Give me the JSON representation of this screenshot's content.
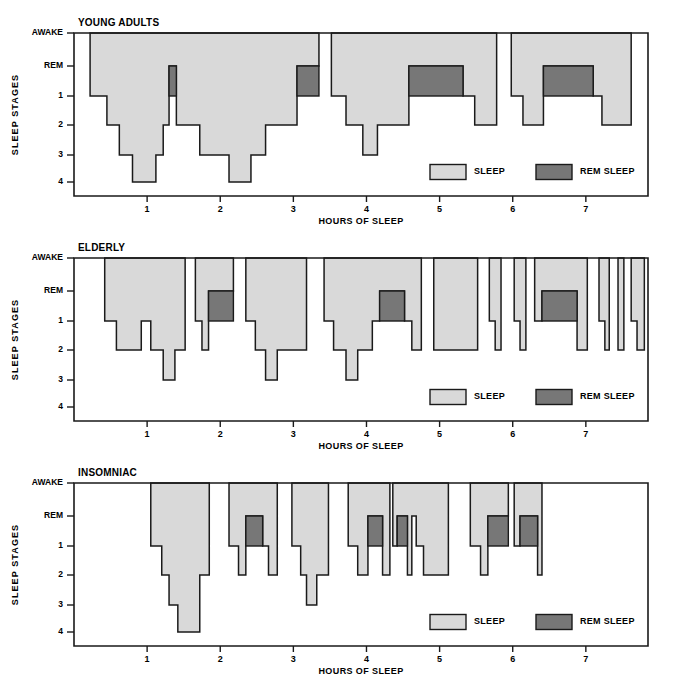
{
  "figure": {
    "colors": {
      "sleep_fill": "#d9d9d9",
      "rem_fill": "#777777",
      "outline": "#1a1a1a",
      "background": "#ffffff"
    },
    "axis_title_y": "SLEEP STAGES",
    "axis_title_x": "HOURS OF SLEEP",
    "y_categories": [
      "AWAKE",
      "REM",
      "1",
      "2",
      "3",
      "4"
    ],
    "x_ticks": [
      1,
      2,
      3,
      4,
      5,
      6,
      7
    ],
    "legend": {
      "sleep_label": "SLEEP",
      "rem_label": "REM SLEEP"
    }
  },
  "chart_data": [
    {
      "type": "area",
      "title": "YOUNG ADULTS",
      "xlabel": "HOURS OF SLEEP",
      "ylabel": "SLEEP STAGES",
      "xlim": [
        0,
        7.85
      ],
      "ylevels": [
        "AWAKE",
        "REM",
        "1",
        "2",
        "3",
        "4"
      ],
      "grid": false,
      "legend_position": "inside-bottom-right",
      "sleep_segments": [
        [
          [
            0.22,
            "AWAKE"
          ],
          [
            0.22,
            "1"
          ],
          [
            0.45,
            "1"
          ],
          [
            0.45,
            "2"
          ],
          [
            0.62,
            "2"
          ],
          [
            0.62,
            "3"
          ],
          [
            0.8,
            "3"
          ],
          [
            0.8,
            "4"
          ],
          [
            1.12,
            "4"
          ],
          [
            1.12,
            "3"
          ],
          [
            1.22,
            "3"
          ],
          [
            1.22,
            "2"
          ],
          [
            1.3,
            "2"
          ],
          [
            1.3,
            "REM"
          ],
          [
            1.4,
            "REM"
          ],
          [
            1.4,
            "2"
          ],
          [
            1.72,
            "2"
          ],
          [
            1.72,
            "3"
          ],
          [
            2.12,
            "3"
          ],
          [
            2.12,
            "4"
          ],
          [
            2.42,
            "4"
          ],
          [
            2.42,
            "3"
          ],
          [
            2.62,
            "3"
          ],
          [
            2.62,
            "2"
          ],
          [
            3.05,
            "2"
          ],
          [
            3.05,
            "REM"
          ],
          [
            3.35,
            "REM"
          ],
          [
            3.35,
            "AWAKE"
          ]
        ],
        [
          [
            3.52,
            "AWAKE"
          ],
          [
            3.52,
            "1"
          ],
          [
            3.72,
            "1"
          ],
          [
            3.72,
            "2"
          ],
          [
            3.95,
            "2"
          ],
          [
            3.95,
            "3"
          ],
          [
            4.15,
            "3"
          ],
          [
            4.15,
            "2"
          ],
          [
            4.58,
            "2"
          ],
          [
            4.58,
            "REM"
          ],
          [
            5.32,
            "REM"
          ],
          [
            5.32,
            "1"
          ],
          [
            5.48,
            "1"
          ],
          [
            5.48,
            "2"
          ],
          [
            5.78,
            "2"
          ],
          [
            5.78,
            "AWAKE"
          ]
        ],
        [
          [
            5.98,
            "AWAKE"
          ],
          [
            5.98,
            "1"
          ],
          [
            6.14,
            "1"
          ],
          [
            6.14,
            "2"
          ],
          [
            6.42,
            "2"
          ],
          [
            6.42,
            "REM"
          ],
          [
            7.1,
            "REM"
          ],
          [
            7.1,
            "1"
          ],
          [
            7.22,
            "1"
          ],
          [
            7.22,
            "2"
          ],
          [
            7.62,
            "2"
          ],
          [
            7.62,
            "AWAKE"
          ]
        ]
      ],
      "rem_blocks": [
        {
          "x0": 1.3,
          "x1": 1.4,
          "top": "REM",
          "bottom": "1"
        },
        {
          "x0": 3.05,
          "x1": 3.35,
          "top": "REM",
          "bottom": "1"
        },
        {
          "x0": 4.58,
          "x1": 5.32,
          "top": "REM",
          "bottom": "1"
        },
        {
          "x0": 6.42,
          "x1": 7.1,
          "top": "REM",
          "bottom": "1"
        }
      ]
    },
    {
      "type": "area",
      "title": "ELDERLY",
      "xlabel": "HOURS OF SLEEP",
      "ylabel": "SLEEP STAGES",
      "xlim": [
        0,
        7.85
      ],
      "ylevels": [
        "AWAKE",
        "REM",
        "1",
        "2",
        "3",
        "4"
      ],
      "grid": false,
      "legend_position": "inside-bottom-right",
      "sleep_segments": [
        [
          [
            0.42,
            "AWAKE"
          ],
          [
            0.42,
            "1"
          ],
          [
            0.58,
            "1"
          ],
          [
            0.58,
            "2"
          ],
          [
            0.92,
            "2"
          ],
          [
            0.92,
            "1"
          ],
          [
            1.05,
            "1"
          ],
          [
            1.05,
            "2"
          ],
          [
            1.22,
            "2"
          ],
          [
            1.22,
            "3"
          ],
          [
            1.38,
            "3"
          ],
          [
            1.38,
            "2"
          ],
          [
            1.52,
            "2"
          ],
          [
            1.52,
            "AWAKE"
          ]
        ],
        [
          [
            1.66,
            "AWAKE"
          ],
          [
            1.66,
            "1"
          ],
          [
            1.75,
            "1"
          ],
          [
            1.75,
            "2"
          ],
          [
            1.84,
            "2"
          ],
          [
            1.84,
            "REM"
          ],
          [
            2.18,
            "REM"
          ],
          [
            2.18,
            "AWAKE"
          ]
        ],
        [
          [
            2.35,
            "AWAKE"
          ],
          [
            2.35,
            "1"
          ],
          [
            2.48,
            "1"
          ],
          [
            2.48,
            "2"
          ],
          [
            2.62,
            "2"
          ],
          [
            2.62,
            "3"
          ],
          [
            2.78,
            "3"
          ],
          [
            2.78,
            "2"
          ],
          [
            3.18,
            "2"
          ],
          [
            3.18,
            "AWAKE"
          ]
        ],
        [
          [
            3.42,
            "AWAKE"
          ],
          [
            3.42,
            "1"
          ],
          [
            3.55,
            "1"
          ],
          [
            3.55,
            "2"
          ],
          [
            3.72,
            "2"
          ],
          [
            3.72,
            "3"
          ],
          [
            3.88,
            "3"
          ],
          [
            3.88,
            "2"
          ],
          [
            4.08,
            "2"
          ],
          [
            4.08,
            "1"
          ],
          [
            4.18,
            "1"
          ],
          [
            4.18,
            "REM"
          ],
          [
            4.52,
            "REM"
          ],
          [
            4.52,
            "1"
          ],
          [
            4.62,
            "1"
          ],
          [
            4.62,
            "2"
          ],
          [
            4.75,
            "2"
          ],
          [
            4.75,
            "AWAKE"
          ]
        ],
        [
          [
            4.92,
            "AWAKE"
          ],
          [
            4.92,
            "2"
          ],
          [
            5.52,
            "2"
          ],
          [
            5.52,
            "AWAKE"
          ]
        ],
        [
          [
            5.68,
            "AWAKE"
          ],
          [
            5.68,
            "1"
          ],
          [
            5.76,
            "1"
          ],
          [
            5.76,
            "2"
          ],
          [
            5.84,
            "2"
          ],
          [
            5.84,
            "AWAKE"
          ]
        ],
        [
          [
            6.02,
            "AWAKE"
          ],
          [
            6.02,
            "1"
          ],
          [
            6.1,
            "1"
          ],
          [
            6.1,
            "2"
          ],
          [
            6.18,
            "2"
          ],
          [
            6.18,
            "AWAKE"
          ]
        ],
        [
          [
            6.3,
            "AWAKE"
          ],
          [
            6.3,
            "1"
          ],
          [
            6.4,
            "1"
          ],
          [
            6.4,
            "REM"
          ],
          [
            6.88,
            "REM"
          ],
          [
            6.88,
            "2"
          ],
          [
            7.02,
            "2"
          ],
          [
            7.02,
            "AWAKE"
          ]
        ],
        [
          [
            7.18,
            "AWAKE"
          ],
          [
            7.18,
            "1"
          ],
          [
            7.26,
            "1"
          ],
          [
            7.26,
            "2"
          ],
          [
            7.32,
            "2"
          ],
          [
            7.32,
            "AWAKE"
          ]
        ],
        [
          [
            7.44,
            "AWAKE"
          ],
          [
            7.44,
            "2"
          ],
          [
            7.52,
            "2"
          ],
          [
            7.52,
            "AWAKE"
          ]
        ],
        [
          [
            7.62,
            "AWAKE"
          ],
          [
            7.62,
            "1"
          ],
          [
            7.7,
            "1"
          ],
          [
            7.7,
            "2"
          ],
          [
            7.8,
            "2"
          ],
          [
            7.8,
            "AWAKE"
          ]
        ]
      ],
      "rem_blocks": [
        {
          "x0": 1.84,
          "x1": 2.18,
          "top": "REM",
          "bottom": "1"
        },
        {
          "x0": 4.18,
          "x1": 4.52,
          "top": "REM",
          "bottom": "1"
        },
        {
          "x0": 6.4,
          "x1": 6.88,
          "top": "REM",
          "bottom": "1"
        }
      ]
    },
    {
      "type": "area",
      "title": "INSOMNIAC",
      "xlabel": "HOURS OF SLEEP",
      "ylabel": "SLEEP STAGES",
      "xlim": [
        0,
        7.85
      ],
      "ylevels": [
        "AWAKE",
        "REM",
        "1",
        "2",
        "3",
        "4"
      ],
      "grid": false,
      "legend_position": "inside-bottom-right",
      "sleep_segments": [
        [
          [
            1.05,
            "AWAKE"
          ],
          [
            1.05,
            "1"
          ],
          [
            1.2,
            "1"
          ],
          [
            1.2,
            "2"
          ],
          [
            1.3,
            "2"
          ],
          [
            1.3,
            "3"
          ],
          [
            1.42,
            "3"
          ],
          [
            1.42,
            "4"
          ],
          [
            1.72,
            "4"
          ],
          [
            1.72,
            "2"
          ],
          [
            1.85,
            "2"
          ],
          [
            1.85,
            "AWAKE"
          ]
        ],
        [
          [
            2.12,
            "AWAKE"
          ],
          [
            2.12,
            "1"
          ],
          [
            2.25,
            "1"
          ],
          [
            2.25,
            "2"
          ],
          [
            2.35,
            "2"
          ],
          [
            2.35,
            "REM"
          ],
          [
            2.58,
            "REM"
          ],
          [
            2.58,
            "1"
          ],
          [
            2.66,
            "1"
          ],
          [
            2.66,
            "2"
          ],
          [
            2.78,
            "2"
          ],
          [
            2.78,
            "AWAKE"
          ]
        ],
        [
          [
            2.98,
            "AWAKE"
          ],
          [
            2.98,
            "1"
          ],
          [
            3.1,
            "1"
          ],
          [
            3.1,
            "2"
          ],
          [
            3.18,
            "2"
          ],
          [
            3.18,
            "3"
          ],
          [
            3.32,
            "3"
          ],
          [
            3.32,
            "2"
          ],
          [
            3.48,
            "2"
          ],
          [
            3.48,
            "AWAKE"
          ]
        ],
        [
          [
            3.75,
            "AWAKE"
          ],
          [
            3.75,
            "1"
          ],
          [
            3.88,
            "1"
          ],
          [
            3.88,
            "2"
          ],
          [
            4.02,
            "2"
          ],
          [
            4.02,
            "REM"
          ],
          [
            4.22,
            "REM"
          ],
          [
            4.22,
            "2"
          ],
          [
            4.32,
            "2"
          ],
          [
            4.32,
            "AWAKE"
          ]
        ],
        [
          [
            4.36,
            "AWAKE"
          ],
          [
            4.36,
            "1"
          ],
          [
            4.42,
            "1"
          ],
          [
            4.42,
            "REM"
          ],
          [
            4.56,
            "REM"
          ],
          [
            4.56,
            "2"
          ],
          [
            4.62,
            "2"
          ],
          [
            4.62,
            "REM"
          ],
          [
            4.68,
            "REM"
          ],
          [
            4.68,
            "1"
          ],
          [
            4.78,
            "1"
          ],
          [
            4.78,
            "2"
          ],
          [
            5.12,
            "2"
          ],
          [
            5.12,
            "AWAKE"
          ]
        ],
        [
          [
            5.42,
            "AWAKE"
          ],
          [
            5.42,
            "1"
          ],
          [
            5.56,
            "1"
          ],
          [
            5.56,
            "2"
          ],
          [
            5.66,
            "2"
          ],
          [
            5.66,
            "REM"
          ],
          [
            5.94,
            "REM"
          ],
          [
            5.94,
            "AWAKE"
          ]
        ],
        [
          [
            6.02,
            "AWAKE"
          ],
          [
            6.02,
            "1"
          ],
          [
            6.1,
            "1"
          ],
          [
            6.1,
            "REM"
          ],
          [
            6.34,
            "REM"
          ],
          [
            6.34,
            "2"
          ],
          [
            6.4,
            "2"
          ],
          [
            6.4,
            "AWAKE"
          ]
        ]
      ],
      "rem_blocks": [
        {
          "x0": 2.35,
          "x1": 2.58,
          "top": "REM",
          "bottom": "1"
        },
        {
          "x0": 4.02,
          "x1": 4.22,
          "top": "REM",
          "bottom": "1"
        },
        {
          "x0": 4.42,
          "x1": 4.56,
          "top": "REM",
          "bottom": "1"
        },
        {
          "x0": 5.66,
          "x1": 5.94,
          "top": "REM",
          "bottom": "1"
        },
        {
          "x0": 6.1,
          "x1": 6.34,
          "top": "REM",
          "bottom": "1"
        }
      ]
    }
  ]
}
